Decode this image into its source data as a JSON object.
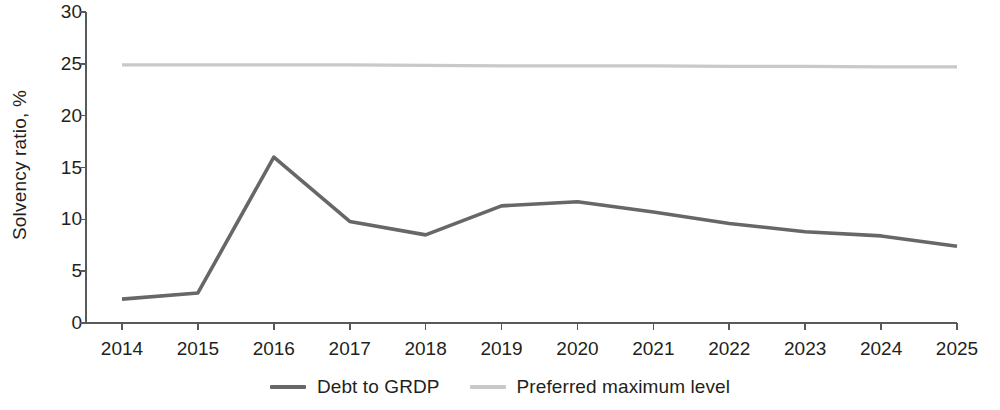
{
  "chart_data": {
    "type": "line",
    "title": "",
    "xlabel": "",
    "ylabel": "Solvency ratio, %",
    "categories": [
      "2014",
      "2015",
      "2016",
      "2017",
      "2018",
      "2019",
      "2020",
      "2021",
      "2022",
      "2023",
      "2024",
      "2025"
    ],
    "ylim": [
      0,
      30
    ],
    "yticks": [
      "0",
      "5",
      "10",
      "15",
      "20",
      "25",
      "30"
    ],
    "grid": false,
    "legend_position": "bottom",
    "series": [
      {
        "name": "Debt to GRDP",
        "color": "#676767",
        "values": [
          2.3,
          2.9,
          16.0,
          9.8,
          8.5,
          11.3,
          11.7,
          10.7,
          9.6,
          8.8,
          8.4,
          7.4
        ]
      },
      {
        "name": "Preferred maximum level",
        "color": "#c9c9c9",
        "values": [
          24.9,
          24.9,
          24.9,
          24.9,
          24.85,
          24.8,
          24.8,
          24.8,
          24.75,
          24.75,
          24.7,
          24.7
        ]
      }
    ]
  },
  "axis": {
    "line_color": "#58595b"
  },
  "legend": {
    "items": [
      {
        "label": "Debt to GRDP",
        "color": "#676767"
      },
      {
        "label": "Preferred maximum level",
        "color": "#c9c9c9"
      }
    ]
  }
}
